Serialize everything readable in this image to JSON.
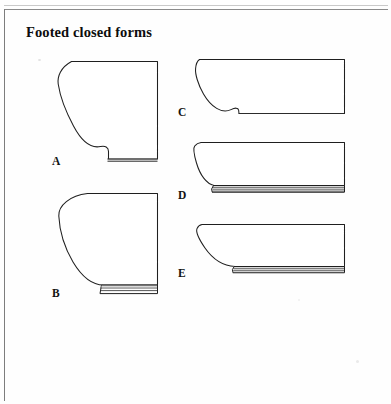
{
  "plate": {
    "title": "Footed closed forms",
    "background_color": "#fefefe",
    "ink_color": "#1a1a1a",
    "frame_color": "#7d7d7d",
    "width": 391,
    "height": 404
  },
  "figures": [
    {
      "id": "A",
      "label": "A",
      "label_x": 52,
      "label_y": 156,
      "caption": "Footed closed form profile A",
      "foot_type": "low disc foot, narrow",
      "foot_lines": 2,
      "column": "left",
      "row": 1
    },
    {
      "id": "B",
      "label": "B",
      "label_x": 52,
      "label_y": 288,
      "caption": "Footed closed form profile B",
      "foot_type": "ring foot, banded",
      "foot_lines": 4,
      "column": "left",
      "row": 2
    },
    {
      "id": "C",
      "label": "C",
      "label_x": 178,
      "label_y": 107,
      "caption": "Footed closed form profile C",
      "foot_type": "flat base with slight step",
      "foot_lines": 1,
      "column": "right",
      "row": 1
    },
    {
      "id": "D",
      "label": "D",
      "label_x": 178,
      "label_y": 190,
      "caption": "Footed closed form profile D",
      "foot_type": "wide banded foot, full width",
      "foot_lines": 4,
      "column": "right",
      "row": 2
    },
    {
      "id": "E",
      "label": "E",
      "label_x": 178,
      "label_y": 268,
      "caption": "Footed closed form profile E",
      "foot_type": "banded foot, inset left",
      "foot_lines": 4,
      "column": "right",
      "row": 3
    }
  ]
}
